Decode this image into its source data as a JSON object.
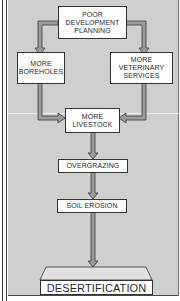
{
  "diagram": {
    "type": "flowchart",
    "nodes": [
      {
        "id": "poor_planning",
        "label": "POOR\nDEVELOPMENT\nPLANNING"
      },
      {
        "id": "boreholes",
        "label": "MORE\nBOREHOLES"
      },
      {
        "id": "veterinary",
        "label": "MORE\nVETERINARY\nSERVICES"
      },
      {
        "id": "livestock",
        "label": "MORE\nLIVESTOCK"
      },
      {
        "id": "overgrazing",
        "label": "OVERGRAZING"
      },
      {
        "id": "soil_erosion",
        "label": "SOIL EROSION"
      },
      {
        "id": "desertification",
        "label": "DESERTIFICATION"
      }
    ],
    "edges": [
      {
        "from": "poor_planning",
        "to": "boreholes"
      },
      {
        "from": "poor_planning",
        "to": "veterinary"
      },
      {
        "from": "boreholes",
        "to": "livestock"
      },
      {
        "from": "veterinary",
        "to": "livestock"
      },
      {
        "from": "livestock",
        "to": "overgrazing"
      },
      {
        "from": "overgrazing",
        "to": "soil_erosion"
      },
      {
        "from": "soil_erosion",
        "to": "desertification"
      }
    ],
    "colors": {
      "background": "#cfcfcf",
      "box_fill": "#ffffff",
      "arrow_fill": "#9a9a9a",
      "arrow_outline": "#3a3a3a"
    }
  }
}
